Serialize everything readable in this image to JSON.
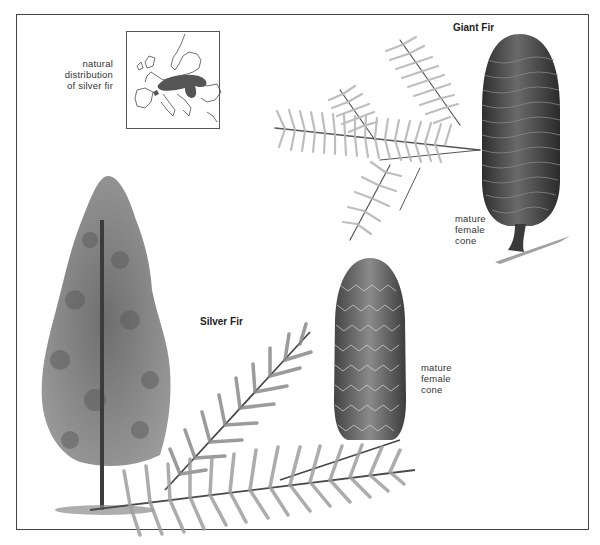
{
  "figure": {
    "map": {
      "caption_lines": [
        "natural",
        "distribution",
        "of silver fir"
      ],
      "region_color": "#555555"
    },
    "giant_fir": {
      "title": "Giant Fir",
      "cone_label_lines": [
        "mature",
        "female",
        "cone"
      ]
    },
    "silver_fir": {
      "title": "Silver Fir",
      "cone_label_lines": [
        "mature",
        "female",
        "cone"
      ]
    },
    "colors": {
      "frame": "#444444",
      "needle_light": "#b5b5b5",
      "needle_dark": "#6a6a6a",
      "cone_dark": "#3d3d3d",
      "tree_foliage": "#7d7d7d"
    }
  }
}
